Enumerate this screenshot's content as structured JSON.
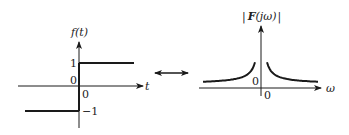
{
  "left_plot": {
    "y_label": "f(t)",
    "x_label": "t",
    "origin_label_left": "0",
    "origin_label_below": "0",
    "tick_pos_label": "1",
    "tick_neg_label": "−1",
    "signal": "sign function: -1 for t<0, +1 for t>0"
  },
  "transform_arrow": {
    "icon": "double-arrow-icon",
    "meaning": "Fourier transform pair"
  },
  "right_plot": {
    "y_label_prefix": "|",
    "y_label_func": "F",
    "y_label_arg": "(jω)",
    "y_label_suffix": "|",
    "x_label": "ω",
    "origin_label_left": "0",
    "origin_label_below": "0",
    "signal": "magnitude spectrum 2/|ω|"
  },
  "colors": {
    "stroke": "#1a1a1a",
    "text": "#222222",
    "background": "#ffffff"
  }
}
